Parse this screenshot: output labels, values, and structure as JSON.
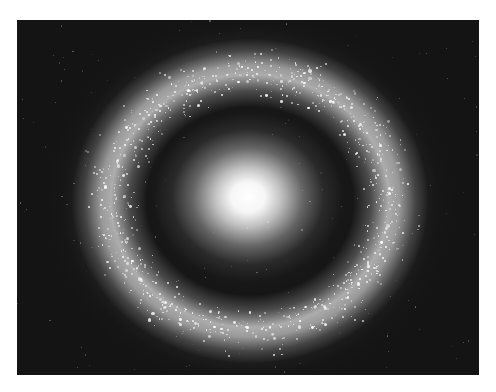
{
  "image": {
    "subject": "ring galaxy",
    "colors": {
      "page_background": "#ffffff",
      "panel_background": "#141414",
      "core": "#ffffff",
      "ring": "#bdbdbd",
      "stars": "#ffffff"
    },
    "panel": {
      "x": 17,
      "y": 20,
      "width": 462,
      "height": 355
    },
    "core": {
      "cx": 231,
      "cy": 177,
      "rx": 95,
      "ry": 85
    },
    "ring": {
      "cx": 233,
      "cy": 181,
      "rx": 178,
      "ry": 162,
      "band_inner": 0.62,
      "band_outer": 0.95
    },
    "stars": {
      "count": 900,
      "seed": 7
    }
  }
}
